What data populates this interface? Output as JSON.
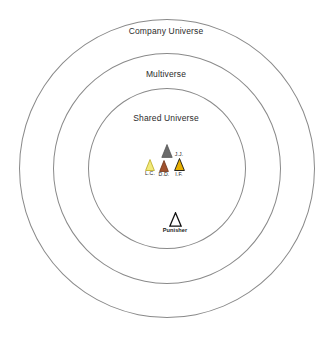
{
  "diagram": {
    "type": "concentric-venn",
    "background_color": "#ffffff",
    "ring_stroke_color": "#8a8a8a",
    "rings": [
      {
        "id": "outer",
        "label": "Company Universe"
      },
      {
        "id": "middle",
        "label": "Multiverse"
      },
      {
        "id": "inner",
        "label": "Shared Universe"
      }
    ],
    "markers": [
      {
        "id": "grey",
        "icon": "triangle-icon",
        "label": "",
        "top_label": "",
        "fill": "#6b6b6b",
        "stroke": "#4a4a4a"
      },
      {
        "id": "lc",
        "icon": "triangle-icon",
        "label": "L.C.",
        "top_label": "",
        "fill": "#f2ea7a",
        "stroke": "#b9a81e"
      },
      {
        "id": "dd",
        "icon": "triangle-icon",
        "label": "D.D.",
        "top_label": "",
        "fill": "#a0522d",
        "stroke": "#6e3418"
      },
      {
        "id": "if",
        "icon": "triangle-icon",
        "label": "I.F.",
        "top_label": "J.J.",
        "fill": "#e8b000",
        "stroke": "#111111"
      },
      {
        "id": "punisher",
        "icon": "triangle-outline-icon",
        "label": "Punisher",
        "top_label": "",
        "fill": "#ffffff",
        "stroke": "#111111"
      }
    ]
  }
}
